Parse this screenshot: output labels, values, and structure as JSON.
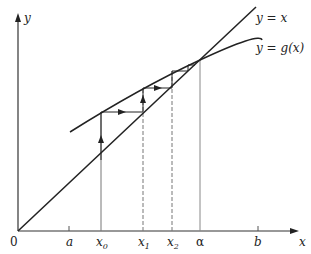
{
  "figure": {
    "axes": {
      "y_label": "y",
      "x_label": "x",
      "origin_label": "0"
    },
    "curves": {
      "identity_label": "y = x",
      "g_label": "y = g(x)"
    },
    "ticks": [
      {
        "label": "a",
        "sub": ""
      },
      {
        "label": "x",
        "sub": "0"
      },
      {
        "label": "x",
        "sub": "1"
      },
      {
        "label": "x",
        "sub": "2"
      },
      {
        "label": "α",
        "sub": ""
      },
      {
        "label": "b",
        "sub": ""
      }
    ],
    "colors": {
      "line": "#222222",
      "guide": "#8a8a8a"
    }
  }
}
